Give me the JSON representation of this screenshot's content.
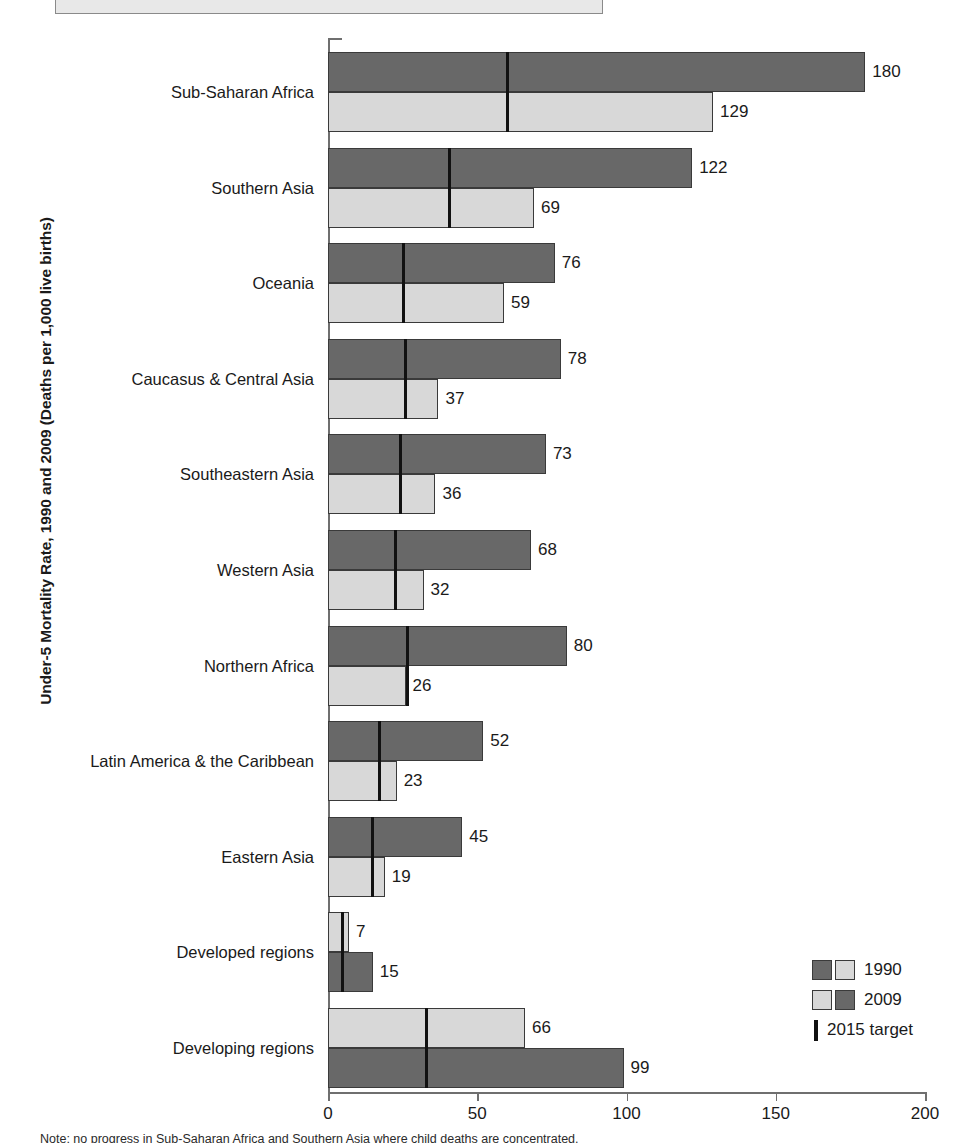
{
  "chart_data": {
    "type": "bar",
    "orientation": "horizontal",
    "title": "",
    "ylabel": "Under-5 Mortality Rate, 1990 and 2009 (Deaths per 1,000 live births)",
    "xlabel": "",
    "xlim": [
      0,
      200
    ],
    "xticks": [
      0,
      50,
      100,
      150,
      200
    ],
    "xticklabels": [
      "0",
      "50",
      "100",
      "150",
      "200"
    ],
    "grid": false,
    "legend_position": "bottom-right",
    "categories": [
      "Sub-Saharan Africa",
      "Southern Asia",
      "Oceania",
      "Caucasus & Central Asia",
      "Southeastern Asia",
      "Western Asia",
      "Northern Africa",
      "Latin America & the Caribbean",
      "Eastern Asia",
      "Developed regions",
      "Developing regions"
    ],
    "series": [
      {
        "name": "1990",
        "values": [
          180,
          122,
          76,
          78,
          73,
          68,
          80,
          52,
          45,
          15,
          99
        ]
      },
      {
        "name": "2009",
        "values": [
          129,
          69,
          59,
          37,
          36,
          32,
          26,
          23,
          19,
          7,
          66
        ]
      },
      {
        "name": "2015 target",
        "values": [
          60,
          40.7,
          25.3,
          26,
          24.3,
          22.7,
          26.7,
          17.3,
          15,
          5,
          33
        ]
      }
    ],
    "bar_order_top_is_1990": [
      true,
      true,
      true,
      true,
      true,
      true,
      true,
      true,
      true,
      false,
      false
    ],
    "legend": [
      {
        "label": "1990",
        "swatches": [
          "dark",
          "light"
        ]
      },
      {
        "label": "2009",
        "swatches": [
          "light",
          "dark"
        ]
      },
      {
        "label": "2015 target",
        "swatches": [
          "target-line"
        ]
      }
    ]
  },
  "colors": {
    "series_1990": "#686868",
    "series_2009": "#d8d8d8",
    "target_line": "#111111",
    "axis": "#6f6f6f",
    "text": "#1a1a1a",
    "background": "#ffffff"
  },
  "footnote": {
    "text": "Note: no progress in Sub-Saharan Africa and Southern Asia where child deaths are concentrated."
  }
}
